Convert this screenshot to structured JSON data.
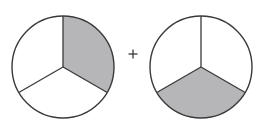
{
  "diagram": {
    "operator": "+",
    "colors": {
      "stroke": "#3a3a3a",
      "shaded": "#b6b6b9",
      "unshaded": "#ffffff"
    },
    "circles": [
      {
        "name": "left-circle",
        "center": [
          63,
          67
        ],
        "radius": 51,
        "parts": 3,
        "shaded_parts": 1,
        "shaded_sector": "upper-right"
      },
      {
        "name": "right-circle",
        "center": [
          201,
          67
        ],
        "radius": 51,
        "parts": 3,
        "shaded_parts": 1,
        "shaded_sector": "bottom"
      }
    ]
  }
}
